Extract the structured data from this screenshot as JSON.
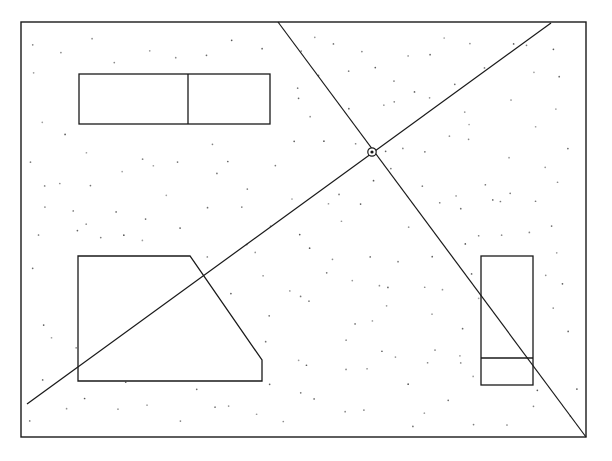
{
  "document": {
    "title": "Architectural Floor Plan Sketch",
    "type": "line-drawing",
    "width": 612,
    "height": 461,
    "background_color": "#ffffff",
    "stroke_color": "#1a1a1a",
    "stipple_color": "#555555"
  },
  "drawing": {
    "border": {
      "name": "outer-boundary",
      "x": 21,
      "y": 22,
      "width": 565,
      "height": 415,
      "stroke_width": 1.4
    },
    "stipple": {
      "name": "stipple-texture",
      "dot_count": 232,
      "dot_radius": 0.85,
      "seed": 20250117,
      "margin": 8
    },
    "shapes": [
      {
        "name": "upper-left-double-room",
        "type": "rect-pair",
        "x": 79,
        "y": 74,
        "width": 191,
        "height": 50,
        "divider_x": 188,
        "divider_orientation": "vertical",
        "stroke_width": 1.3
      },
      {
        "name": "lower-left-chamfered-room",
        "type": "polygon",
        "points": "78,256 190,256 262,360 262,381 78,381",
        "stroke_width": 1.3
      },
      {
        "name": "right-double-room",
        "type": "rect-pair",
        "x": 481,
        "y": 256,
        "width": 52,
        "height": 129,
        "divider_y": 358,
        "divider_orientation": "horizontal",
        "stroke_width": 1.3
      }
    ],
    "diagonals": [
      {
        "name": "diagonal-descending",
        "x1": 278,
        "y1": 22,
        "x2": 586,
        "y2": 437,
        "stroke_width": 1.2
      },
      {
        "name": "diagonal-ascending",
        "x1": 27,
        "y1": 404,
        "x2": 551,
        "y2": 23,
        "stroke_width": 1.2
      }
    ],
    "intersection_marker": {
      "name": "diagonal-intersection-node",
      "cx": 372,
      "cy": 152,
      "r": 4.2,
      "inner_r": 1.6,
      "stroke_width": 1.2
    }
  }
}
